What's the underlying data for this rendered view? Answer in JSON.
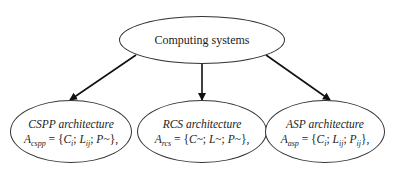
{
  "diagram": {
    "root": {
      "label": "Computing systems"
    },
    "children": [
      {
        "title": "CSPP architecture",
        "formula": {
          "lhs": "A",
          "lhs_sub": "cspp",
          "eq": " = {",
          "c": "C",
          "c_sub": "i",
          "sep1": "; ",
          "l": "L",
          "l_sub": "ij",
          "sep2": "; ",
          "p": "P",
          "p_sub": "~",
          "tail": "},"
        }
      },
      {
        "title": "RCS architecture",
        "formula": {
          "lhs": "A",
          "lhs_sub": "rcs",
          "eq": " = {",
          "c": "C",
          "c_sub": "~",
          "sep1": "; ",
          "l": "L",
          "l_sub": "~",
          "sep2": "; ",
          "p": "P",
          "p_sub": "~",
          "tail": "},"
        }
      },
      {
        "title": "ASP architecture",
        "formula": {
          "lhs": "A",
          "lhs_sub": "asp",
          "eq": " = {",
          "c": "C",
          "c_sub": "i",
          "sep1": "; ",
          "l": "L",
          "l_sub": "ij",
          "sep2": "; ",
          "p": "P",
          "p_sub": "ij",
          "tail": "},"
        }
      }
    ],
    "edges": [
      {
        "from": "Computing systems",
        "to": "CSPP architecture"
      },
      {
        "from": "Computing systems",
        "to": "RCS architecture"
      },
      {
        "from": "Computing systems",
        "to": "ASP architecture"
      }
    ],
    "colors": {
      "stroke": "#222222",
      "background": "#ffffff"
    }
  }
}
